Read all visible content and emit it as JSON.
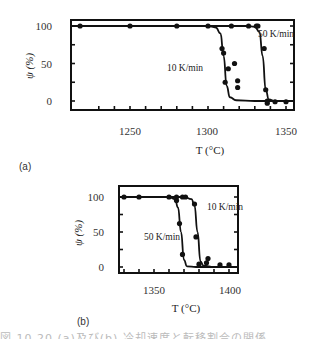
{
  "chart_data": [
    {
      "id": "a",
      "panel_label": "(a)",
      "type": "line",
      "xlabel": "T (°C)",
      "ylabel": "ψ (%)",
      "xlim": [
        1212,
        1356
      ],
      "ylim": [
        -8,
        110
      ],
      "xticks": [
        1250,
        1300,
        1350
      ],
      "yticks": [
        0,
        50,
        100
      ],
      "grid": false,
      "series": [
        {
          "name": "10 K/min",
          "points": [
            [
              1218,
              100
            ],
            [
              1250,
              100
            ],
            [
              1280,
              100
            ],
            [
              1300,
              100
            ],
            [
              1309,
              70
            ],
            [
              1310,
              64
            ],
            [
              1311,
              25
            ],
            [
              1313,
              43
            ],
            [
              1317,
              50
            ],
            [
              1319,
              27
            ],
            [
              1319,
              18
            ]
          ],
          "curve": [
            [
              1212,
              100
            ],
            [
              1300,
              100
            ],
            [
              1305,
              98
            ],
            [
              1308,
              90
            ],
            [
              1310,
              60
            ],
            [
              1312,
              20
            ],
            [
              1314,
              5
            ],
            [
              1318,
              1
            ],
            [
              1330,
              0
            ],
            [
              1356,
              0
            ]
          ]
        },
        {
          "name": "50 K/min",
          "points": [
            [
              1315,
              100
            ],
            [
              1326,
              100
            ],
            [
              1331,
              100
            ],
            [
              1332,
              100
            ],
            [
              1336,
              70
            ],
            [
              1337,
              15
            ],
            [
              1338,
              -3
            ],
            [
              1338,
              0
            ],
            [
              1343,
              -1
            ],
            [
              1350,
              -1
            ]
          ],
          "curve": [
            [
              1212,
              100
            ],
            [
              1325,
              100
            ],
            [
              1330,
              99
            ],
            [
              1333,
              92
            ],
            [
              1335,
              60
            ],
            [
              1337,
              15
            ],
            [
              1339,
              2
            ],
            [
              1343,
              0
            ],
            [
              1356,
              0
            ]
          ]
        }
      ],
      "annotations": [
        "10 K/min",
        "50 K/min"
      ]
    },
    {
      "id": "b",
      "panel_label": "(b)",
      "type": "line",
      "xlabel": "T (°C)",
      "ylabel": "ψ (%)",
      "xlim": [
        1327,
        1406
      ],
      "ylim": [
        -8,
        115
      ],
      "xticks": [
        1350,
        1400
      ],
      "yticks": [
        0,
        50,
        100
      ],
      "grid": false,
      "series": [
        {
          "name": "50 K/min",
          "points": [
            [
              1330,
              100
            ],
            [
              1340,
              100
            ],
            [
              1360,
              100
            ],
            [
              1365,
              100
            ],
            [
              1365,
              95
            ],
            [
              1367,
              62
            ],
            [
              1369,
              18
            ]
          ],
          "curve": [
            [
              1327,
              100
            ],
            [
              1360,
              100
            ],
            [
              1364,
              97
            ],
            [
              1366,
              85
            ],
            [
              1368,
              50
            ],
            [
              1370,
              10
            ],
            [
              1372,
              1
            ],
            [
              1378,
              0
            ],
            [
              1406,
              0
            ]
          ]
        },
        {
          "name": "10 K/min",
          "points": [
            [
              1369,
              100
            ],
            [
              1371,
              100
            ],
            [
              1377,
              90
            ],
            [
              1378,
              43
            ],
            [
              1380,
              4
            ],
            [
              1385,
              6
            ],
            [
              1386,
              12
            ],
            [
              1394,
              3
            ],
            [
              1400,
              3
            ]
          ],
          "curve": [
            [
              1327,
              100
            ],
            [
              1370,
              100
            ],
            [
              1375,
              97
            ],
            [
              1377,
              88
            ],
            [
              1379,
              50
            ],
            [
              1381,
              8
            ],
            [
              1383,
              2
            ],
            [
              1390,
              0
            ],
            [
              1406,
              0
            ]
          ]
        }
      ],
      "annotations": [
        "10 K/min",
        "50 K/min"
      ]
    }
  ],
  "labels": {
    "a": {
      "y100": "100",
      "y50": "50",
      "y0": "0",
      "x1250": "1250",
      "x1300": "1300",
      "x1350": "1350",
      "ylabel": "ψ (%)",
      "xlabel": "T (°C)",
      "ann10": "10 K/min",
      "ann50": "50 K/min",
      "panel": "(a)"
    },
    "b": {
      "y100": "100",
      "y50": "50",
      "y0": "0",
      "x1350": "1350",
      "x1400": "1400",
      "ylabel": "ψ (%)",
      "xlabel": "T (°C)",
      "ann10": "10 K/min",
      "ann50": "50 K/min",
      "panel": "(b)"
    }
  },
  "caption": "図 10.20 (a)及び(b) 冷却速度と転移割合の関係"
}
